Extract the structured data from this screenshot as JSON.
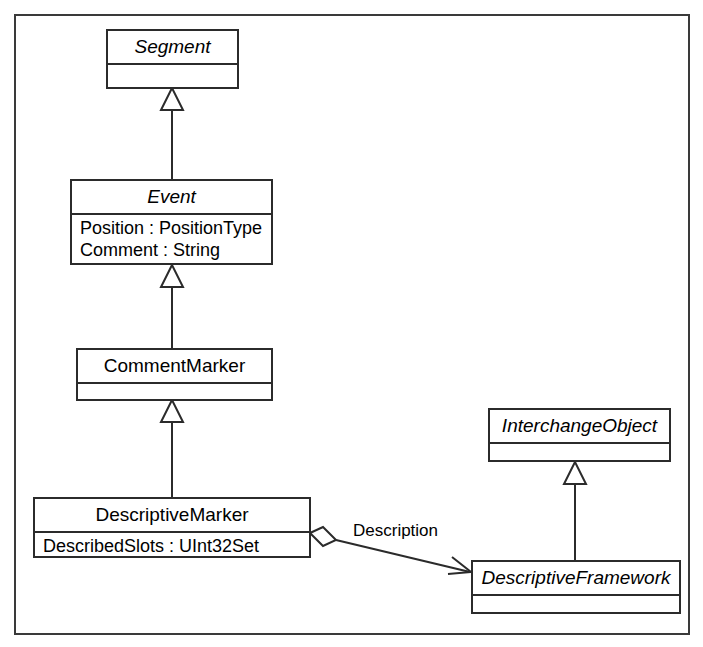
{
  "diagram": {
    "type": "uml-class-diagram",
    "frame": {
      "border_color": "#3a3a3a",
      "background": "#ffffff"
    },
    "line_color": "#2b2b2b",
    "classes": [
      {
        "id": "segment",
        "name": "Segment",
        "abstract": true,
        "attributes": []
      },
      {
        "id": "event",
        "name": "Event",
        "abstract": true,
        "attributes": [
          "Position : PositionType",
          "Comment : String"
        ]
      },
      {
        "id": "comment-marker",
        "name": "CommentMarker",
        "abstract": false,
        "attributes": []
      },
      {
        "id": "descriptive-marker",
        "name": "DescriptiveMarker",
        "abstract": false,
        "attributes": [
          "DescribedSlots : UInt32Set"
        ]
      },
      {
        "id": "interchange-object",
        "name": "InterchangeObject",
        "abstract": true,
        "attributes": []
      },
      {
        "id": "descriptive-framework",
        "name": "DescriptiveFramework",
        "abstract": true,
        "attributes": []
      }
    ],
    "relationships": [
      {
        "id": "gen-event-segment",
        "kind": "generalization",
        "from": "Event",
        "to": "Segment"
      },
      {
        "id": "gen-commentmarker-event",
        "kind": "generalization",
        "from": "CommentMarker",
        "to": "Event"
      },
      {
        "id": "gen-descriptivemarker-commentmarker",
        "kind": "generalization",
        "from": "DescriptiveMarker",
        "to": "CommentMarker"
      },
      {
        "id": "gen-descriptiveframework-interchangeobject",
        "kind": "generalization",
        "from": "DescriptiveFramework",
        "to": "InterchangeObject"
      },
      {
        "id": "assoc-description",
        "kind": "aggregation",
        "from": "DescriptiveMarker",
        "to": "DescriptiveFramework",
        "label": "Description"
      }
    ]
  }
}
